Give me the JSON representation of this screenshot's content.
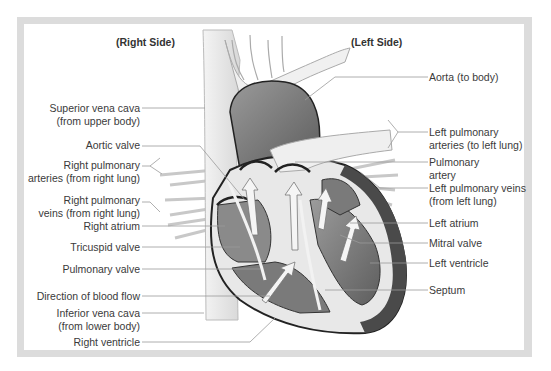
{
  "headers": {
    "right_side": "(Right Side)",
    "left_side": "(Left Side)"
  },
  "left_labels": [
    {
      "line1": "Superior vena cava",
      "line2": "(from upper body)"
    },
    {
      "line1": "Aortic valve"
    },
    {
      "line1": "Right pulmonary",
      "line2": "arteries (from right lung)"
    },
    {
      "line1": "Right pulmonary",
      "line2": "veins (from right lung)"
    },
    {
      "line1": "Right atrium"
    },
    {
      "line1": "Tricuspid valve"
    },
    {
      "line1": "Pulmonary valve"
    },
    {
      "line1": "Direction of blood flow"
    },
    {
      "line1": "Inferior vena cava",
      "line2": "(from lower body)"
    },
    {
      "line1": "Right ventricle"
    }
  ],
  "right_labels": [
    {
      "line1": "Aorta (to body)"
    },
    {
      "line1": "Left pulmonary",
      "line2": "arteries (to left lung)"
    },
    {
      "line1": "Pulmonary",
      "line2": "artery"
    },
    {
      "line1": "Left pulmonary veins",
      "line2": "(from left lung)"
    },
    {
      "line1": "Left atrium"
    },
    {
      "line1": "Mitral valve"
    },
    {
      "line1": "Left ventricle"
    },
    {
      "line1": "Septum"
    }
  ],
  "colors": {
    "frame": "#dcdcdc",
    "heart_dark": "#5a5a5a",
    "heart_mid": "#7d7d7d",
    "heart_light": "#a8a8a8",
    "vessel": "#ececec",
    "leader_line": "#9a9a9a"
  }
}
